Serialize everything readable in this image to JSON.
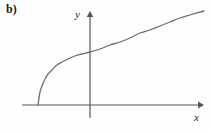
{
  "figure": {
    "part_label": "b)",
    "background_color": "#fefefe",
    "line_color": "#6e6e6e",
    "axis_color": "#555555",
    "text_color": "#1a1a1a"
  },
  "axes": {
    "y_label": "y",
    "x_label": "x",
    "y_axis_name": "y-axis",
    "x_axis_name": "x-axis",
    "y_arrow_name": "y-axis-arrowhead",
    "x_arrow_name": "x-axis-arrowhead"
  },
  "chart_data": {
    "type": "line",
    "title": "b)",
    "xlabel": "x",
    "ylabel": "y",
    "grid": false,
    "legend": null,
    "origin_px": [
      90,
      105
    ],
    "xlim_px": [
      22,
      201
    ],
    "ylim_px": [
      118,
      13
    ],
    "series": [
      {
        "name": "curve",
        "points_px": [
          [
            38,
            105
          ],
          [
            40,
            92
          ],
          [
            42,
            86
          ],
          [
            45,
            79
          ],
          [
            48,
            74
          ],
          [
            52,
            70
          ],
          [
            57,
            65
          ],
          [
            62,
            62
          ],
          [
            68,
            59
          ],
          [
            75,
            56
          ],
          [
            82,
            54
          ],
          [
            90,
            52
          ],
          [
            100,
            49
          ],
          [
            110,
            45
          ],
          [
            120,
            42
          ],
          [
            130,
            38
          ],
          [
            140,
            33
          ],
          [
            150,
            30
          ],
          [
            160,
            26
          ],
          [
            170,
            22
          ],
          [
            180,
            18
          ],
          [
            190,
            15
          ],
          [
            204,
            11
          ]
        ],
        "x_intercept_px": 38,
        "y_intercept_px": 52
      }
    ]
  }
}
